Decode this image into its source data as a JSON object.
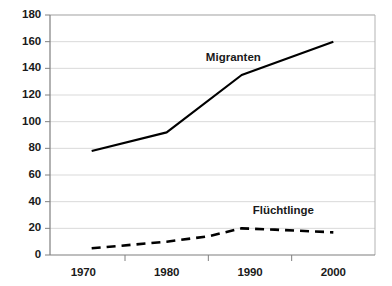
{
  "chart_data": {
    "type": "line",
    "title": "",
    "xlabel": "",
    "ylabel": "",
    "xlim": [
      1966,
      2005
    ],
    "ylim": [
      0,
      180
    ],
    "ytick_step": 20,
    "yticks": [
      "0",
      "20",
      "40",
      "60",
      "80",
      "100",
      "120",
      "140",
      "160",
      "180"
    ],
    "xticks": [
      "1970",
      "1980",
      "1990",
      "2000"
    ],
    "xtick_values": [
      1970,
      1980,
      1990,
      2000
    ],
    "grid": true,
    "legend_position": "inline-annotation",
    "series": [
      {
        "name": "Migranten",
        "style": "solid",
        "color": "#000000",
        "x": [
          1971,
          1980,
          1989,
          2000
        ],
        "values": [
          78,
          92,
          135,
          160
        ]
      },
      {
        "name": "Flüchtlinge",
        "style": "dashed",
        "color": "#000000",
        "x": [
          1971,
          1980,
          1985,
          1989,
          1993,
          2000
        ],
        "values": [
          5,
          10,
          14,
          20,
          19,
          17
        ]
      }
    ],
    "annotations": [
      {
        "text": "Migranten",
        "x": 1988,
        "y": 148
      },
      {
        "text": "Flüchtlinge",
        "x": 1994,
        "y": 33
      }
    ]
  },
  "colors": {
    "axis": "#808080",
    "grid": "#d9d9d9",
    "line": "#000000",
    "text": "#1a1a1a",
    "background": "#ffffff"
  }
}
